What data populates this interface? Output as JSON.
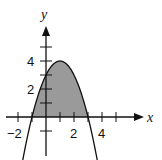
{
  "chart_data": {
    "type": "area",
    "title": "",
    "function": "y = -x^2 + 2x + 3",
    "xlabel": "x",
    "ylabel": "y",
    "x_ticks": [
      -2,
      -1,
      0,
      1,
      2,
      3,
      4,
      5
    ],
    "y_ticks": [
      -1,
      1,
      2,
      3,
      4,
      5
    ],
    "x_tick_labels": [
      "−2",
      "2",
      "4"
    ],
    "y_tick_labels": [
      "2",
      "4"
    ],
    "xlim": [
      -2.8,
      6
    ],
    "ylim": [
      -2.6,
      5.5
    ],
    "vertex": [
      1,
      4
    ],
    "roots": [
      -1,
      3
    ],
    "y_intercept": 3,
    "shaded_region": {
      "from_x": -1,
      "to_x": 3,
      "between": "curve and x-axis",
      "color": "#9a9a9a"
    },
    "grid": false,
    "legend": null
  },
  "labels": {
    "x_axis": "x",
    "y_axis": "y",
    "tick_neg2": "−2",
    "tick_x2": "2",
    "tick_x4": "4",
    "tick_y2": "2",
    "tick_y4": "4"
  }
}
